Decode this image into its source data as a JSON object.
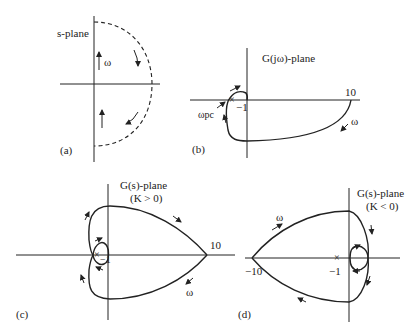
{
  "panels": {
    "a": {
      "tag": "(a)",
      "plane_label": "s-plane",
      "omega_label": "ω",
      "contour": "Nyquist D-contour (dashed semicircle, clockwise)"
    },
    "b": {
      "tag": "(b)",
      "plane_label": "G(jω)-plane",
      "point_minus1": "−1",
      "point_10": "10",
      "omega_label": "ω",
      "omega_pc_label": "ωpc"
    },
    "c": {
      "tag": "(c)",
      "plane_label": "G(s)-plane",
      "condition": "(K > 0)",
      "point_minus1": "−1",
      "point_10": "10",
      "omega_label": "ω"
    },
    "d": {
      "tag": "(d)",
      "plane_label": "G(s)-plane",
      "condition": "(K < 0)",
      "point_minus1": "−1",
      "point_minus10": "−10",
      "omega_label": "ω"
    }
  },
  "colors": {
    "ink": "#222222",
    "background": "#ffffff"
  }
}
